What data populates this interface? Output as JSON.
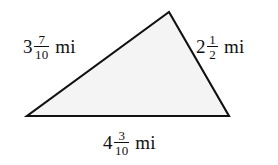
{
  "figure": {
    "kind": "triangle-with-side-labels",
    "background_color": "#ffffff",
    "fill_color": "#f4f4f4",
    "stroke_color": "#111111",
    "unit": "mi",
    "vertices": {
      "apex": [
        169,
        12
      ],
      "bottom_left": [
        27,
        116
      ],
      "bottom_right": [
        229,
        116
      ]
    },
    "sides": {
      "left": {
        "whole": "3",
        "numerator": "7",
        "denominator": "10",
        "unit": "mi",
        "full_text": "3 7/10 mi"
      },
      "right": {
        "whole": "2",
        "numerator": "1",
        "denominator": "2",
        "unit": "mi",
        "full_text": "2 1/2 mi"
      },
      "bottom": {
        "whole": "4",
        "numerator": "3",
        "denominator": "10",
        "unit": "mi",
        "full_text": "4 3/10 mi"
      }
    }
  }
}
